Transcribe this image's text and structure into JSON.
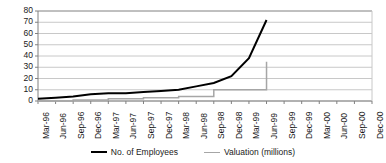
{
  "chart_data": {
    "type": "line",
    "title": "",
    "xlabel": "",
    "ylabel": "",
    "ylim": [
      0,
      80
    ],
    "ytick_step": 10,
    "grid": true,
    "legend_position": "bottom",
    "yticks": [
      80,
      70,
      60,
      50,
      40,
      30,
      20,
      10,
      0
    ],
    "categories": [
      "Mar-96",
      "Jun-96",
      "Sep-96",
      "Dec-96",
      "Mar-97",
      "Jun-97",
      "Sep-97",
      "Dec-97",
      "Mar-98",
      "Jun-98",
      "Sep-98",
      "Dec-98",
      "Mar-99",
      "Jun-99",
      "Sep-99",
      "Dec-99",
      "Mar-00",
      "Jun-00",
      "Sep-00",
      "Dec-00"
    ],
    "series": [
      {
        "name": "No. of Employees",
        "color": "#000000",
        "width": 2,
        "values": [
          2,
          3,
          4,
          6,
          7,
          7,
          8,
          9,
          10,
          13,
          16,
          22,
          38,
          72,
          null,
          null,
          null,
          null,
          null,
          null
        ]
      },
      {
        "name": "Valuation (millions)",
        "color": "#a6a6a6",
        "width": 1.5,
        "step": true,
        "values": [
          0,
          0,
          1,
          1,
          2,
          2,
          3,
          3,
          4,
          4,
          10,
          10,
          10,
          35,
          null,
          null,
          null,
          null,
          null,
          null
        ]
      }
    ]
  },
  "legend": {
    "items": [
      {
        "label": "No. of Employees"
      },
      {
        "label": "Valuation (millions)"
      }
    ]
  },
  "colors": {
    "employees_line": "#000000",
    "valuation_line": "#a6a6a6",
    "grid": "#c8c8c8",
    "axis": "#808080",
    "text": "#1a1a1a",
    "background": "#ffffff"
  }
}
